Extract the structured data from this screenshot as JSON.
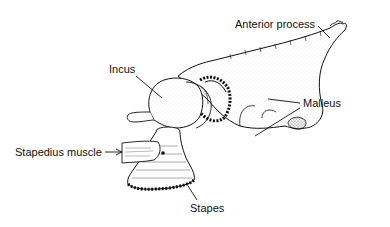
{
  "diagram": {
    "style": "black ink stippled line drawing on white",
    "colors": {
      "ink": "#111111",
      "background": "#ffffff"
    },
    "labels": {
      "anterior_process": "Anterior process",
      "incus": "Incus",
      "malleus": "Malleus",
      "stapedius_muscle": "Stapedius muscle",
      "stapes": "Stapes"
    }
  }
}
